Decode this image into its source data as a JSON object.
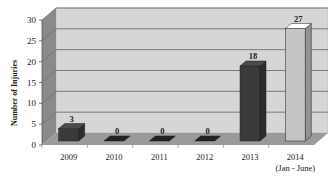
{
  "chart_data": {
    "type": "bar",
    "style": "3d",
    "title": "",
    "xlabel": "",
    "ylabel": "Number of Injuries",
    "ylim": [
      0,
      30
    ],
    "yticks": [
      0,
      5,
      10,
      15,
      20,
      25,
      30
    ],
    "grid": true,
    "legend": null,
    "categories": [
      "2009",
      "2010",
      "2011",
      "2012",
      "2013",
      "2014"
    ],
    "category_sublabels": [
      "",
      "",
      "",
      "",
      "",
      "(Jan - June)"
    ],
    "values": [
      3,
      0,
      0,
      0,
      18,
      27
    ],
    "data_labels": [
      "3",
      "0",
      "0",
      "0",
      "18",
      "27"
    ],
    "bar_colors": [
      "#3a3a3a",
      "#2e2e2e",
      "#2e2e2e",
      "#2e2e2e",
      "#3a3a3a",
      "#c4c4c4"
    ]
  },
  "colors": {
    "back_wall": "#d6d6d6",
    "side_wall": "#8a8a8a",
    "floor": "#9a9a9a",
    "gridline": "#7a7a7a"
  }
}
